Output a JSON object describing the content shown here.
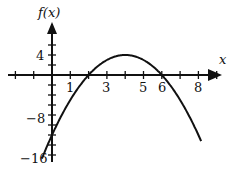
{
  "chart_data": {
    "type": "line",
    "title": "",
    "xlabel": "x",
    "ylabel": "f(x)",
    "function": "f(x) = -(x-2)(x-6)",
    "xlim": [
      -2.5,
      9.5
    ],
    "ylim": [
      -17,
      7
    ],
    "grid": false,
    "legend": "none",
    "x_tick_labels": [
      "1",
      "3",
      "5",
      "6",
      "8"
    ],
    "x_tick_values": [
      1,
      3,
      5,
      6,
      8
    ],
    "y_tick_labels": [
      "4",
      "-8",
      "-16"
    ],
    "y_tick_values": [
      4,
      -8,
      -16
    ],
    "series": [
      {
        "name": "f(x)",
        "x": [
          -0.5,
          0,
          1,
          2,
          3,
          4,
          5,
          6,
          7,
          8
        ],
        "y": [
          -16.25,
          -12,
          -5,
          0,
          3,
          4,
          3,
          0,
          -5,
          -12
        ]
      }
    ],
    "annotations": [
      "x-intercepts at x=2 and x=6",
      "maximum at (4, 4)"
    ]
  },
  "labels": {
    "x_axis": "x",
    "y_axis": "f(x)",
    "x_ticks": [
      "1",
      "3",
      "5",
      "6",
      "8"
    ],
    "y_ticks": [
      "4",
      "−8",
      "−16"
    ]
  }
}
